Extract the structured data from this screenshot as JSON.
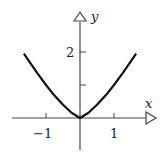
{
  "chart_data": {
    "type": "line",
    "title": "",
    "xlabel": "x",
    "ylabel": "y",
    "x_ticks": [
      -1,
      1
    ],
    "x_tick_labels": [
      "−1",
      "1"
    ],
    "y_ticks": [
      1,
      2
    ],
    "y_tick_labels": [
      "",
      "2"
    ],
    "xlim": [
      -1.65,
      1.65
    ],
    "ylim": [
      0,
      2
    ],
    "grid": false,
    "legend": null,
    "series": [
      {
        "name": "y = |x|^(4/3)",
        "x": [
          -1.65,
          -1.5,
          -1.25,
          -1.0,
          -0.75,
          -0.5,
          -0.25,
          0,
          0.25,
          0.5,
          0.75,
          1.0,
          1.25,
          1.5,
          1.65
        ],
        "y": [
          1.95,
          1.72,
          1.35,
          1.0,
          0.68,
          0.4,
          0.16,
          0,
          0.16,
          0.4,
          0.68,
          1.0,
          1.35,
          1.72,
          1.95
        ]
      }
    ],
    "colors": {
      "axis": "#444444",
      "curve": "#111111"
    }
  }
}
